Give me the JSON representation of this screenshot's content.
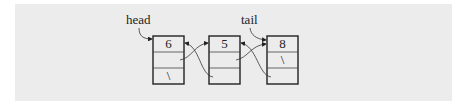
{
  "diagram": {
    "type": "doubly-linked-list",
    "labels": {
      "head": "head",
      "tail": "tail"
    },
    "nodes": [
      {
        "value": "6",
        "next": "",
        "prev": "\\"
      },
      {
        "value": "5",
        "next": "",
        "prev": ""
      },
      {
        "value": "8",
        "next": "\\",
        "prev": ""
      }
    ],
    "colors": {
      "background": "#ececec",
      "stroke": "#222222"
    }
  }
}
